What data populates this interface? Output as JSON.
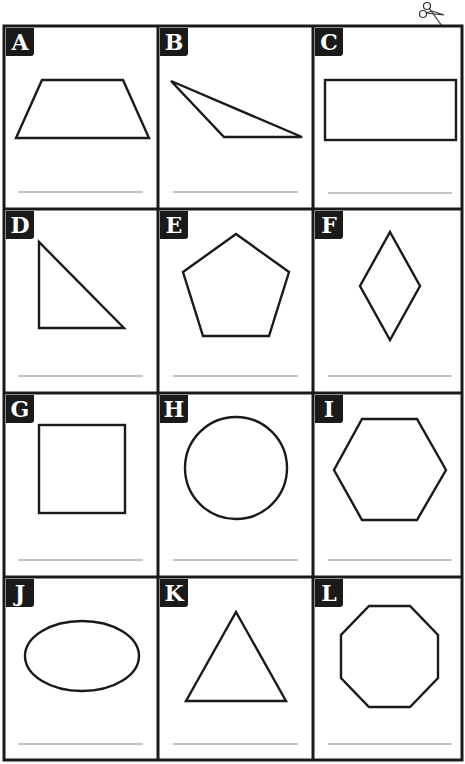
{
  "worksheet": {
    "title": "Shapes worksheet",
    "cut_icon": "scissors-icon",
    "cells": [
      {
        "label": "A",
        "shape": "trapezoid"
      },
      {
        "label": "B",
        "shape": "obtuse-triangle"
      },
      {
        "label": "C",
        "shape": "rectangle"
      },
      {
        "label": "D",
        "shape": "right-triangle"
      },
      {
        "label": "E",
        "shape": "pentagon"
      },
      {
        "label": "F",
        "shape": "rhombus"
      },
      {
        "label": "G",
        "shape": "square"
      },
      {
        "label": "H",
        "shape": "circle"
      },
      {
        "label": "I",
        "shape": "hexagon"
      },
      {
        "label": "J",
        "shape": "oval"
      },
      {
        "label": "K",
        "shape": "triangle"
      },
      {
        "label": "L",
        "shape": "octagon"
      }
    ]
  },
  "colors": {
    "ink": "#1a1a1a",
    "line": "#8a8a8a",
    "paper": "#ffffff"
  }
}
